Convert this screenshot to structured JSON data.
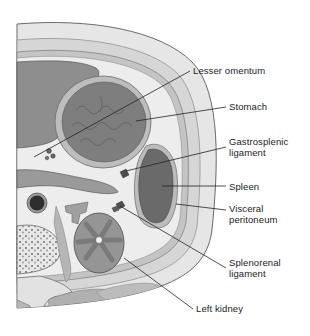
{
  "figure": {
    "labels": [
      {
        "id": "lesser-omentum",
        "text": "Lesser omentum",
        "lines": [
          "Lesser omentum"
        ],
        "x": 193,
        "y": 65
      },
      {
        "id": "stomach",
        "text": "Stomach",
        "lines": [
          "Stomach"
        ],
        "x": 229,
        "y": 101
      },
      {
        "id": "gastrosplenic-ligament",
        "text": "Gastrosplenic ligament",
        "lines": [
          "Gastrosplenic",
          "ligament"
        ],
        "x": 229,
        "y": 136
      },
      {
        "id": "spleen",
        "text": "Spleen",
        "lines": [
          "Spleen"
        ],
        "x": 229,
        "y": 182
      },
      {
        "id": "visceral-peritoneum",
        "text": "Visceral peritoneum",
        "lines": [
          "Visceral",
          "peritoneum"
        ],
        "x": 229,
        "y": 204
      },
      {
        "id": "splenorenal-ligament",
        "text": "Splenorenal ligament",
        "lines": [
          "Splenorenal",
          "ligament"
        ],
        "x": 229,
        "y": 257
      },
      {
        "id": "left-kidney",
        "text": "Left kidney",
        "lines": [
          "Left kidney"
        ],
        "x": 196,
        "y": 303
      }
    ],
    "colors": {
      "background": "#ffffff",
      "skin": "#e4e4e4",
      "fat": "#d2d2d2",
      "muscle": "#a8a8a8",
      "liver": "#8c8c8c",
      "stomach": "#7e7e7e",
      "spleen": "#6a6a6a",
      "kidney": "#8a8a8a",
      "leader_line": "#222222",
      "text": "#222222"
    }
  }
}
